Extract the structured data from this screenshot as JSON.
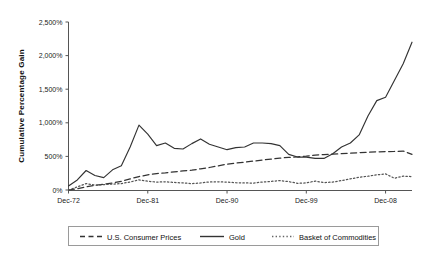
{
  "chart_data": {
    "type": "line",
    "title": "",
    "subtitle": "",
    "xlabel": "",
    "ylabel": "Cumulative Percentage Gain",
    "ylim": [
      0,
      2500
    ],
    "xlim": [
      1972,
      2011
    ],
    "grid": false,
    "legend_position": "bottom",
    "y_tick_labels": [
      "0%",
      "500%",
      "1,000%",
      "1,500%",
      "2,000%",
      "2,500%"
    ],
    "y_tick_values": [
      0,
      500,
      1000,
      1500,
      2000,
      2500
    ],
    "x_tick_labels": [
      "Dec-72",
      "Dec-81",
      "Dec-90",
      "Dec-99",
      "Dec-08"
    ],
    "x_tick_values": [
      1972,
      1981,
      1990,
      1999,
      2008
    ],
    "x": [
      1972,
      1973,
      1974,
      1975,
      1976,
      1977,
      1978,
      1979,
      1980,
      1981,
      1982,
      1983,
      1984,
      1985,
      1986,
      1987,
      1988,
      1989,
      1990,
      1991,
      1992,
      1993,
      1994,
      1995,
      1996,
      1997,
      1998,
      1999,
      2000,
      2001,
      2002,
      2003,
      2004,
      2005,
      2006,
      2007,
      2008,
      2009,
      2010,
      2011
    ],
    "series": [
      {
        "name": "Gold",
        "style": "solid",
        "color": "#333333",
        "values": [
          60,
          150,
          290,
          215,
          185,
          300,
          360,
          640,
          965,
          830,
          660,
          700,
          620,
          610,
          690,
          760,
          680,
          640,
          600,
          630,
          640,
          700,
          700,
          690,
          660,
          530,
          490,
          490,
          470,
          470,
          540,
          640,
          700,
          820,
          1100,
          1330,
          1380,
          1630,
          1880,
          2200
        ],
        "label_format": "percent"
      },
      {
        "name": "U.S. Consumer Prices",
        "style": "dashed",
        "color": "#333333",
        "values": [
          0,
          20,
          48,
          70,
          85,
          105,
          130,
          165,
          200,
          225,
          245,
          255,
          270,
          285,
          295,
          315,
          335,
          360,
          385,
          400,
          415,
          430,
          445,
          460,
          475,
          485,
          492,
          503,
          520,
          528,
          533,
          540,
          548,
          556,
          562,
          568,
          572,
          574,
          580,
          530
        ]
      },
      {
        "name": "Basket of Commodities",
        "style": "dotted",
        "color": "#555555",
        "values": [
          0,
          45,
          95,
          72,
          80,
          88,
          95,
          120,
          150,
          130,
          118,
          122,
          112,
          105,
          95,
          105,
          120,
          122,
          118,
          108,
          105,
          103,
          118,
          128,
          140,
          125,
          100,
          105,
          132,
          110,
          118,
          140,
          165,
          190,
          205,
          225,
          240,
          175,
          205,
          200
        ]
      }
    ]
  },
  "legend": {
    "items": [
      {
        "label": "U.S. Consumer Prices",
        "style": "dashed"
      },
      {
        "label": "Gold",
        "style": "solid"
      },
      {
        "label": "Basket of Commodities",
        "style": "dotted"
      }
    ]
  }
}
